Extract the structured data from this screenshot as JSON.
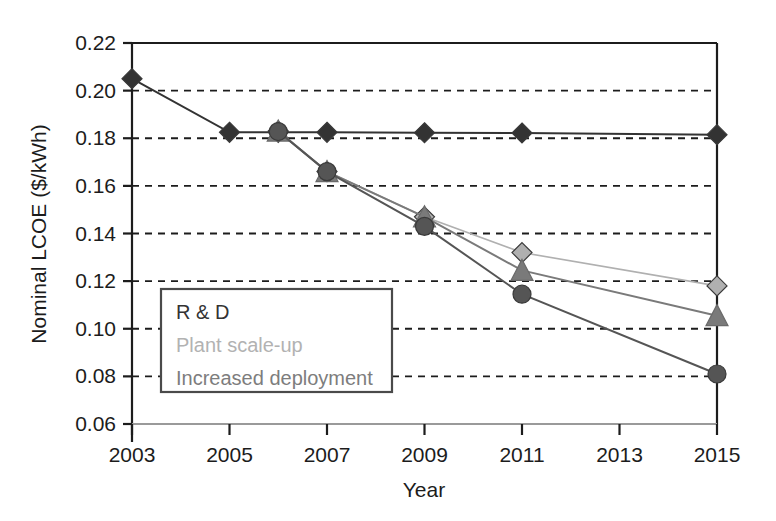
{
  "chart_data": {
    "type": "line",
    "title": "",
    "xlabel": "Year",
    "ylabel": "Nominal LCOE ($/kWh)",
    "xlim": [
      2003,
      2015
    ],
    "ylim": [
      0.06,
      0.22
    ],
    "xticks": [
      "2003",
      "2005",
      "2007",
      "2009",
      "2011",
      "2013",
      "2015"
    ],
    "yticks": [
      "0.06",
      "0.08",
      "0.10",
      "0.12",
      "0.14",
      "0.16",
      "0.18",
      "0.20",
      "0.22"
    ],
    "grid": "horizontal-dashed",
    "legend_position": "lower-left-inside",
    "series": [
      {
        "name": "R & D",
        "color": "#333333",
        "marker": "diamond",
        "x": [
          2003,
          2005,
          2006,
          2007,
          2009,
          2011,
          2015
        ],
        "y": [
          0.205,
          0.1825,
          0.1825,
          0.1825,
          0.1823,
          0.1822,
          0.1815
        ]
      },
      {
        "name": "Plant scale-up",
        "color": "#b0b0b0",
        "marker": "diamond",
        "x": [
          2006,
          2007,
          2009,
          2011,
          2015
        ],
        "y": [
          0.183,
          0.166,
          0.147,
          0.132,
          0.118
        ]
      },
      {
        "name": "Increased deployment",
        "color": "#7a7a7a",
        "marker": "triangle",
        "x": [
          2006,
          2007,
          2009,
          2011,
          2015
        ],
        "y": [
          0.183,
          0.166,
          0.147,
          0.1245,
          0.1055
        ]
      },
      {
        "name": "Combined",
        "color": "#555555",
        "marker": "circle",
        "x": [
          2006,
          2007,
          2009,
          2011,
          2015
        ],
        "y": [
          0.1828,
          0.166,
          0.143,
          0.1145,
          0.081
        ]
      }
    ]
  },
  "axis": {
    "y_title": "Nominal LCOE ($/kWh)",
    "x_title": "Year",
    "y_labels": [
      "0.22",
      "0.20",
      "0.18",
      "0.16",
      "0.14",
      "0.12",
      "0.10",
      "0.08",
      "0.06"
    ],
    "x_labels": [
      "2003",
      "2005",
      "2007",
      "2009",
      "2011",
      "2013",
      "2015"
    ]
  },
  "legend": {
    "entries": [
      {
        "label": "R & D",
        "color": "#333333"
      },
      {
        "label": "Plant scale-up",
        "color": "#b2b2b2"
      },
      {
        "label": "Increased deployment",
        "color": "#7d7d7d"
      }
    ]
  },
  "colors": {
    "axis": "#1c1c1c",
    "grid": "#1c1c1c",
    "rd": "#333333",
    "plant_scale_up": "#b0b0b0",
    "increased_deployment": "#7a7a7a",
    "background": "#ffffff"
  }
}
